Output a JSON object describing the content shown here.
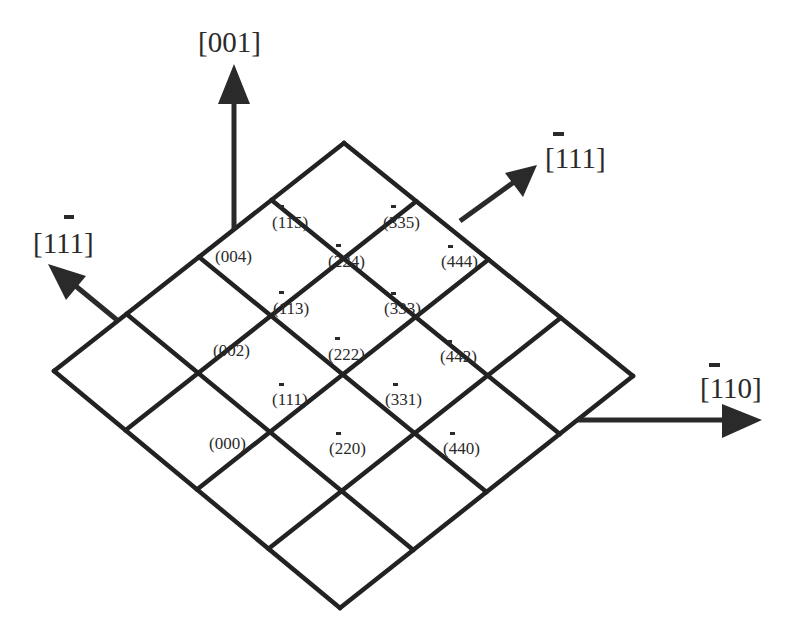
{
  "diagram": {
    "type": "reciprocal-lattice-plane",
    "colors": {
      "line": "#222222",
      "text": "#2a2a2a",
      "background": "#ffffff"
    },
    "grid": {
      "rows": 4,
      "cols": 4,
      "corners": {
        "top": [
          344,
          143
        ],
        "right": [
          633,
          376
        ],
        "bottom": [
          340,
          608
        ],
        "left": [
          54,
          371
        ]
      }
    },
    "axes": [
      {
        "id": "axis-001",
        "text_parts": [
          [
            "[",
            false
          ],
          [
            "0",
            false
          ],
          [
            "0",
            false
          ],
          [
            "1",
            false
          ],
          [
            "]",
            false
          ]
        ],
        "label": "[001]",
        "from": [
          234,
          229
        ],
        "to": [
          234,
          68
        ],
        "label_pos": [
          198,
          26
        ]
      },
      {
        "id": "axis-1-11",
        "label": "[1̅1̅1]",
        "display": "[1 1̄ 1]",
        "from": [
          117,
          320
        ],
        "to": [
          52,
          266
        ],
        "label_pos": [
          33,
          230
        ],
        "barred_index": 1
      },
      {
        "id": "axis--111",
        "label": "[̅1 1 1]",
        "display": "[1̄ 1 1]",
        "from": [
          460,
          220
        ],
        "to": [
          536,
          166
        ],
        "label_pos": [
          545,
          144
        ],
        "barred_index": 0
      },
      {
        "id": "axis--110",
        "label": "[1̄ 1 0]",
        "display": "[1̄ 1 0]",
        "from": [
          577,
          420
        ],
        "to": [
          760,
          420
        ],
        "label_pos": [
          689,
          375
        ],
        "barred_index": 0
      }
    ],
    "axis_labels": {
      "a001": {
        "open": "[",
        "digits": [
          "0",
          "0",
          "1"
        ],
        "close": "]",
        "bar": -1
      },
      "a1m11": {
        "open": "[",
        "digits": [
          "1",
          "1",
          "1"
        ],
        "close": "]",
        "bar": 1
      },
      "am111": {
        "open": "[",
        "digits": [
          "1",
          "1",
          "1"
        ],
        "close": "]",
        "bar": 0
      },
      "am110": {
        "open": "[",
        "digits": [
          "1",
          "1",
          "0"
        ],
        "close": "]",
        "bar": 0
      }
    },
    "points": [
      {
        "label": "(115)",
        "display": "(1̄15)",
        "bar": true,
        "x": 272,
        "y": 228
      },
      {
        "label": "(335)",
        "display": "(3̄35)",
        "bar": true,
        "x": 383,
        "y": 228
      },
      {
        "label": "(004)",
        "display": "(004)",
        "bar": false,
        "x": 215,
        "y": 262
      },
      {
        "label": "(224)",
        "display": "(2̄24)",
        "bar": true,
        "x": 328,
        "y": 267
      },
      {
        "label": "(444)",
        "display": "(4̄44)",
        "bar": true,
        "x": 441,
        "y": 267
      },
      {
        "label": "(113)",
        "display": "(1̄13)",
        "bar": true,
        "x": 273,
        "y": 314
      },
      {
        "label": "(333)",
        "display": "(3̄33)",
        "bar": true,
        "x": 384,
        "y": 314
      },
      {
        "label": "(002)",
        "display": "(002)",
        "bar": false,
        "x": 213,
        "y": 356
      },
      {
        "label": "(222)",
        "display": "(2̄22)",
        "bar": true,
        "x": 328,
        "y": 360
      },
      {
        "label": "(442)",
        "display": "(4̄42)",
        "bar": true,
        "x": 440,
        "y": 362
      },
      {
        "label": "(111)",
        "display": "(1̄11)",
        "bar": true,
        "x": 272,
        "y": 405
      },
      {
        "label": "(331)",
        "display": "(3̄31)",
        "bar": true,
        "x": 385,
        "y": 405
      },
      {
        "label": "(000)",
        "display": "(000)",
        "bar": false,
        "x": 209,
        "y": 449
      },
      {
        "label": "(220)",
        "display": "(2̄20)",
        "bar": true,
        "x": 329,
        "y": 454
      },
      {
        "label": "(440)",
        "display": "(4̄40)",
        "bar": true,
        "x": 443,
        "y": 454
      }
    ],
    "point_texts": {
      "p115": {
        "bar": "1",
        "rest": "15"
      },
      "p335": {
        "bar": "3",
        "rest": "35"
      },
      "p004": {
        "bar": "",
        "rest": "004"
      },
      "p224": {
        "bar": "2",
        "rest": "24"
      },
      "p444": {
        "bar": "4",
        "rest": "44"
      },
      "p113": {
        "bar": "1",
        "rest": "13"
      },
      "p333": {
        "bar": "3",
        "rest": "33"
      },
      "p002": {
        "bar": "",
        "rest": "002"
      },
      "p222": {
        "bar": "2",
        "rest": "22"
      },
      "p442": {
        "bar": "4",
        "rest": "42"
      },
      "p111": {
        "bar": "1",
        "rest": "11"
      },
      "p331": {
        "bar": "3",
        "rest": "31"
      },
      "p000": {
        "bar": "",
        "rest": "000"
      },
      "p220": {
        "bar": "2",
        "rest": "20"
      },
      "p440": {
        "bar": "4",
        "rest": "40"
      }
    }
  }
}
